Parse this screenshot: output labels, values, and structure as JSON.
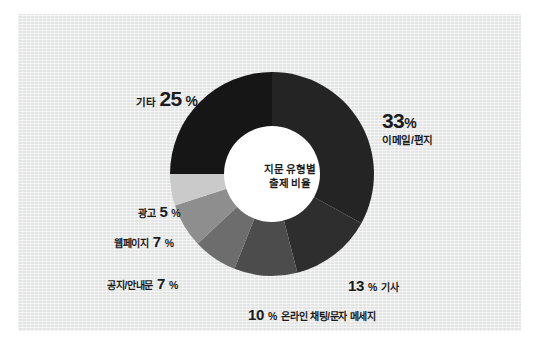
{
  "chart_data": {
    "type": "pie",
    "variant": "donut",
    "title": "지문 유형별 출제 비율",
    "title_line1": "지문 유형별",
    "title_line2": "출제 비율",
    "xlabel": "",
    "ylabel": "",
    "grid": false,
    "legend_position": "callouts-around-donut",
    "unit": "%",
    "categories": [
      "이메일/편지",
      "기사",
      "온라인 채팅/문자 메세지",
      "공지/안내문",
      "웹페이지",
      "광고",
      "기타"
    ],
    "values": [
      33,
      13,
      10,
      7,
      7,
      5,
      25
    ],
    "slices": [
      {
        "label": "이메일/편지",
        "value": 33,
        "value_text": "33",
        "pct_text": "%",
        "color": "#242424"
      },
      {
        "label": "기사",
        "value": 13,
        "value_text": "13",
        "pct_text": "%",
        "color": "#2e2e2e"
      },
      {
        "label": "온라인 채팅/문자 메세지",
        "value": 10,
        "value_text": "10",
        "pct_text": "%",
        "color": "#4c4c4c"
      },
      {
        "label": "공지/안내문",
        "value": 7,
        "value_text": "7",
        "pct_text": "%",
        "color": "#6d6d6d"
      },
      {
        "label": "웹페이지",
        "value": 7,
        "value_text": "7",
        "pct_text": "%",
        "color": "#8e8e8e"
      },
      {
        "label": "광고",
        "value": 5,
        "value_text": "5",
        "pct_text": "%",
        "color": "#c9cac9"
      },
      {
        "label": "기타",
        "value": 25,
        "value_text": "25",
        "pct_text": "%",
        "color": "#161616"
      }
    ],
    "colors": {
      "background": "#e9eaea",
      "page": "#ffffff",
      "text": "#1b1b1b",
      "hub": "#ffffff"
    }
  }
}
